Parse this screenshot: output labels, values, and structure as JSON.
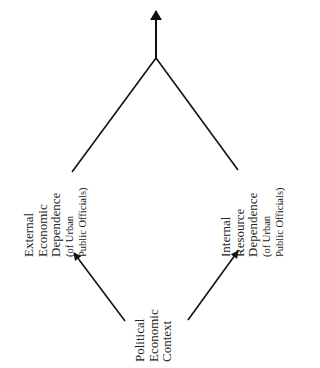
{
  "diagram": {
    "type": "flow-diagram",
    "orientation": "rotated-90-ccw",
    "colors": {
      "background": "#ffffff",
      "line": "#111111",
      "text": "#222222"
    },
    "nodes": {
      "source": {
        "id": "political-economic-context",
        "lines": [
          "Political",
          "Economic",
          "Context"
        ]
      },
      "left": {
        "id": "external-economic-dependence",
        "lines": [
          "External",
          "Economic",
          "Dependence",
          "(of Urban",
          "Public Officials)"
        ]
      },
      "right": {
        "id": "internal-resource-dependence",
        "lines": [
          "Internal",
          "Resource",
          "Dependence",
          "(of Urban",
          "Public Officials)"
        ]
      }
    },
    "edges": [
      {
        "from": "political-economic-context",
        "to": "external-economic-dependence",
        "arrow": true
      },
      {
        "from": "political-economic-context",
        "to": "internal-resource-dependence",
        "arrow": true
      },
      {
        "from": "external-economic-dependence",
        "to": "merge-point",
        "arrow": false
      },
      {
        "from": "internal-resource-dependence",
        "to": "merge-point",
        "arrow": false
      },
      {
        "from": "merge-point",
        "to": "outcome",
        "arrow": true
      }
    ]
  }
}
